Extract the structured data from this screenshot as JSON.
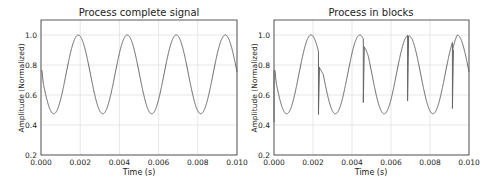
{
  "chart_data": [
    {
      "type": "line",
      "title": "Process complete signal",
      "xlabel": "Time (s)",
      "ylabel": "Amplitude (Normalized)",
      "xlim": [
        0.0,
        0.01
      ],
      "ylim": [
        0.2,
        1.1
      ],
      "xticks": [
        "0.000",
        "0.002",
        "0.004",
        "0.006",
        "0.008",
        "0.010"
      ],
      "yticks": [
        "0.2",
        "0.4",
        "0.6",
        "0.8",
        "1.0"
      ],
      "grid": true,
      "series": [
        {
          "name": "signal",
          "color": "#555555",
          "description": "sinusoid, period ~0.0025 s, min ~0.475, max 1.0, start value ~0.62",
          "peaks_t": [
            0.0019,
            0.0044,
            0.0069,
            0.0094
          ],
          "troughs_t": [
            0.0006,
            0.0031,
            0.0056,
            0.0081
          ],
          "min": 0.475,
          "max": 1.0,
          "glitches": []
        }
      ]
    },
    {
      "type": "line",
      "title": "Process in blocks",
      "xlabel": "Time (s)",
      "ylabel": "Amplitude (Normalized)",
      "xlim": [
        0.0,
        0.01
      ],
      "ylim": [
        0.2,
        1.1
      ],
      "xticks": [
        "0.000",
        "0.002",
        "0.004",
        "0.006",
        "0.008",
        "0.010"
      ],
      "yticks": [
        "0.2",
        "0.4",
        "0.6",
        "0.8",
        "1.0"
      ],
      "grid": true,
      "series": [
        {
          "name": "signal",
          "color": "#555555",
          "description": "same sinusoid with discontinuity glitches at block boundaries",
          "peaks_t": [
            0.0019,
            0.0044,
            0.0069,
            0.0094
          ],
          "troughs_t": [
            0.0006,
            0.0031,
            0.0056,
            0.0081
          ],
          "min": 0.475,
          "max": 1.0,
          "glitches": [
            {
              "t": 0.0,
              "drop_to": 0.42,
              "resume": 0.62
            },
            {
              "t": 0.00228,
              "drop_to": 0.47,
              "resume": 0.78
            },
            {
              "t": 0.00458,
              "drop_to": 0.55,
              "resume": 0.92
            },
            {
              "t": 0.00685,
              "drop_to": 0.56,
              "resume": 0.99
            },
            {
              "t": 0.00915,
              "drop_to": 0.51,
              "resume": 0.9
            }
          ]
        }
      ]
    }
  ]
}
